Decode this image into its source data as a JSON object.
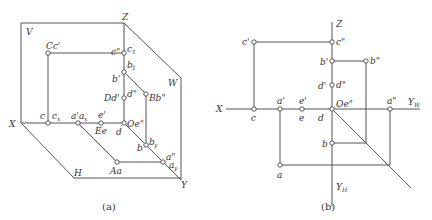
{
  "figure_a": {
    "caption": "(a)",
    "planes": {
      "V": "V",
      "W": "W",
      "H": "H"
    },
    "axes": {
      "X": "X",
      "Y": "Y",
      "Z": "Z",
      "O": "Oe\""
    },
    "labels": {
      "Cc": "Cc'",
      "c2": "c\"",
      "c1": "c",
      "c1_sub": "1",
      "b1": "b",
      "b1_sub": "1",
      "b_prime": "b'",
      "Dd": "Dd'",
      "d2": "d\"",
      "Bb": "Bb\"",
      "c": "c",
      "cx": "c",
      "cx_sub": "x",
      "a_prime": "a'",
      "ax": "a",
      "ax_sub": "x",
      "e_prime": "e'",
      "Ee": "Ee",
      "d": "d",
      "b": "b",
      "by": "b",
      "by_sub": "y",
      "Aa": "Aa",
      "a2": "a\"",
      "ay": "a",
      "ay_sub": "y"
    }
  },
  "figure_b": {
    "caption": "(b)",
    "axes": {
      "X": "X",
      "Z": "Z",
      "O": "Oe\"",
      "YW": "Y",
      "YW_sub": "W",
      "YH": "Y",
      "YH_sub": "H"
    },
    "labels": {
      "c_prime": "c'",
      "c2": "c\"",
      "b_prime": "b'",
      "b2": "b\"",
      "d_prime": "d'",
      "d2": "d\"",
      "a_prime": "a'",
      "e_prime": "e'",
      "a2": "a\"",
      "c": "c",
      "e": "e",
      "d": "d",
      "b": "b",
      "a": "a"
    }
  }
}
